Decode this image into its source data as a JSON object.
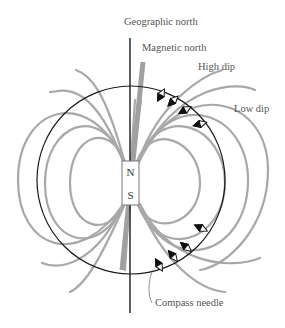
{
  "labels": {
    "geographic_north": "Geographic north",
    "magnetic_north": "Magnetic north",
    "high_dip": "High dip",
    "low_dip": "Low dip",
    "compass_needle": "Compass needle"
  },
  "magnet": {
    "north": "N",
    "south": "S"
  },
  "colors": {
    "field_lines": "#a8a8a8",
    "axis": "#1a1a1a",
    "magnetic_axis": "#a0a0a0",
    "label_text": "#555555"
  }
}
